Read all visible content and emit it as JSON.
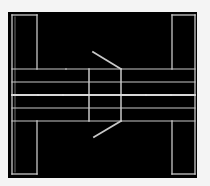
{
  "diagram": {
    "type": "technical-line-drawing",
    "colors": {
      "page_background": "#f4f4f4",
      "panel_background": "#000000",
      "line": "#c8c8c8",
      "center_line": "#d8d8d8",
      "dot": "#e0e0e0"
    },
    "panel": {
      "x": 8,
      "y": 12,
      "w": 189,
      "h": 166
    },
    "left_bracket": {
      "outer_x": 12,
      "inner_x": 37,
      "top_y": 15,
      "bottom_y": 174,
      "band_top_y": 69,
      "band_bottom_y": 121
    },
    "right_bracket": {
      "outer_x": 195,
      "inner_x": 172,
      "top_y": 15,
      "bottom_y": 174,
      "band_top_y": 69,
      "band_bottom_y": 121
    },
    "horizontal_lines_y": [
      69,
      82,
      95,
      108,
      121
    ],
    "center_line_y": 95,
    "center_box": {
      "left_x": 89,
      "right_x": 121,
      "top_y": 69,
      "bottom_y": 121
    },
    "diagonals": [
      {
        "x1": 121,
        "y1": 69,
        "x2": 93,
        "y2": 52
      },
      {
        "x1": 121,
        "y1": 121,
        "x2": 94,
        "y2": 137
      }
    ],
    "center_dots_x": [
      38,
      63,
      89,
      121,
      146,
      171
    ]
  }
}
